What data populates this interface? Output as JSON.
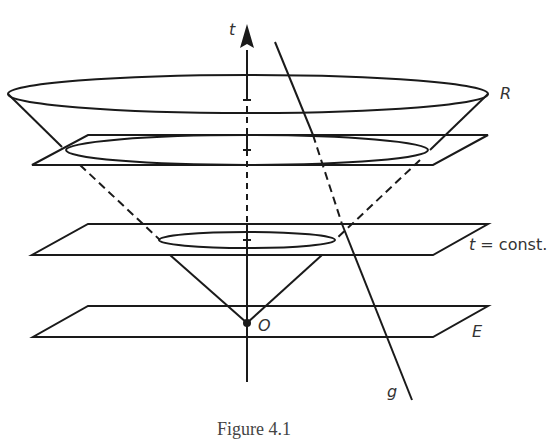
{
  "figure": {
    "caption": "Figure 4.1",
    "labels": {
      "time_axis": "t",
      "rim": "R",
      "plane": "t = const.",
      "origin": "O",
      "base_plane": "E",
      "worldline": "g"
    },
    "colors": {
      "stroke": "#1a1a1a",
      "text": "#333333",
      "background": "#ffffff"
    }
  }
}
